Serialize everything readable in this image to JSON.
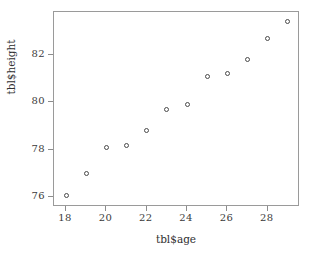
{
  "chart_data": {
    "type": "scatter",
    "title": "",
    "xlabel": "tbl$age",
    "ylabel": "tbl$height",
    "xlim": [
      17.4,
      29.6
    ],
    "ylim": [
      75.6,
      83.8
    ],
    "grid": false,
    "legend": false,
    "marker": "open-circle",
    "marker_color": "#4a4a4a",
    "xticks": [
      18,
      20,
      22,
      24,
      26,
      28
    ],
    "yticks": [
      76,
      78,
      80,
      82
    ],
    "xtick_labels": [
      "18",
      "20",
      "22",
      "24",
      "26",
      "28"
    ],
    "ytick_labels": [
      "76",
      "78",
      "80",
      "82"
    ],
    "x": [
      18,
      19,
      20,
      21,
      22,
      23,
      24,
      25,
      26,
      27,
      28,
      29
    ],
    "y": [
      76.1,
      77.0,
      78.1,
      78.2,
      78.8,
      79.7,
      79.9,
      81.1,
      81.2,
      81.8,
      82.7,
      83.4
    ],
    "points": [
      {
        "x": 18,
        "y": 76.1
      },
      {
        "x": 19,
        "y": 77.0
      },
      {
        "x": 20,
        "y": 78.1
      },
      {
        "x": 21,
        "y": 78.2
      },
      {
        "x": 22,
        "y": 78.8
      },
      {
        "x": 23,
        "y": 79.7
      },
      {
        "x": 24,
        "y": 79.9
      },
      {
        "x": 25,
        "y": 81.1
      },
      {
        "x": 26,
        "y": 81.2
      },
      {
        "x": 27,
        "y": 81.8
      },
      {
        "x": 28,
        "y": 82.7
      },
      {
        "x": 29,
        "y": 83.4
      }
    ]
  }
}
